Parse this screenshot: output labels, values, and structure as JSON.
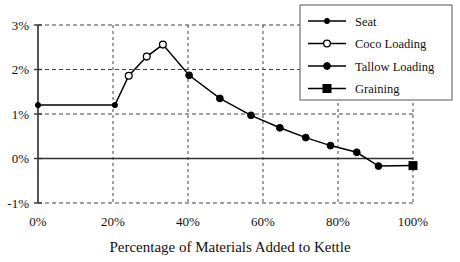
{
  "chart_data": {
    "type": "line",
    "title": "",
    "subtitle": "",
    "xlabel": "Percentage of Materials Added to Kettle",
    "ylabel": "",
    "xlim": [
      0,
      100
    ],
    "ylim": [
      -1,
      3
    ],
    "grid": true,
    "grid_style": "dashed",
    "zero_line": true,
    "legend_position": "top-right",
    "x_ticks": [
      0,
      20,
      40,
      60,
      80,
      100
    ],
    "x_tick_labels": [
      "0%",
      "20%",
      "40%",
      "60%",
      "80%",
      "100%"
    ],
    "y_ticks": [
      -1,
      0,
      1,
      2,
      3
    ],
    "y_tick_labels": [
      "-1%",
      "0%",
      "1%",
      "2%",
      "3%"
    ],
    "series": [
      {
        "name": "Seat",
        "marker": "small-filled-circle",
        "color": "#000000",
        "points": [
          {
            "x": 0,
            "y": 1.2
          },
          {
            "x": 20.5,
            "y": 1.2
          }
        ]
      },
      {
        "name": "Coco Loading",
        "marker": "hollow-circle",
        "color": "#000000",
        "points": [
          {
            "x": 24.2,
            "y": 1.86
          },
          {
            "x": 29.0,
            "y": 2.29
          },
          {
            "x": 33.3,
            "y": 2.56
          }
        ]
      },
      {
        "name": "Tallow Loading",
        "marker": "filled-circle",
        "color": "#000000",
        "points": [
          {
            "x": 40.3,
            "y": 1.87
          },
          {
            "x": 48.5,
            "y": 1.35
          },
          {
            "x": 56.8,
            "y": 0.97
          },
          {
            "x": 64.5,
            "y": 0.69
          },
          {
            "x": 71.4,
            "y": 0.47
          },
          {
            "x": 78.0,
            "y": 0.29
          },
          {
            "x": 85.0,
            "y": 0.14
          },
          {
            "x": 90.8,
            "y": -0.17
          }
        ]
      },
      {
        "name": "Graining",
        "marker": "filled-square",
        "color": "#000000",
        "points": [
          {
            "x": 100,
            "y": -0.16
          }
        ]
      }
    ],
    "connected_path": [
      {
        "x": 0,
        "y": 1.2
      },
      {
        "x": 20.5,
        "y": 1.2
      },
      {
        "x": 24.2,
        "y": 1.86
      },
      {
        "x": 29.0,
        "y": 2.29
      },
      {
        "x": 33.3,
        "y": 2.56
      },
      {
        "x": 40.3,
        "y": 1.87
      },
      {
        "x": 48.5,
        "y": 1.35
      },
      {
        "x": 56.8,
        "y": 0.97
      },
      {
        "x": 64.5,
        "y": 0.69
      },
      {
        "x": 71.4,
        "y": 0.47
      },
      {
        "x": 78.0,
        "y": 0.29
      },
      {
        "x": 85.0,
        "y": 0.14
      },
      {
        "x": 90.8,
        "y": -0.17
      },
      {
        "x": 100,
        "y": -0.16
      }
    ]
  },
  "legend": {
    "entries": [
      {
        "label": "Seat",
        "marker": "small-filled-circle"
      },
      {
        "label": "Coco Loading",
        "marker": "hollow-circle"
      },
      {
        "label": "Tallow Loading",
        "marker": "filled-circle"
      },
      {
        "label": "Graining",
        "marker": "filled-square"
      }
    ]
  },
  "axis": {
    "x_title": "Percentage of Materials Added to Kettle",
    "y_title": ""
  }
}
